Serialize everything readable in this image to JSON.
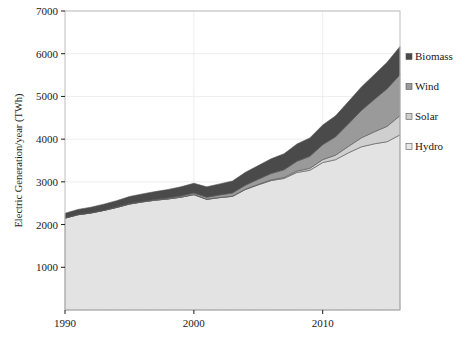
{
  "chart_data": {
    "type": "area",
    "stacked": true,
    "title": "",
    "xlabel": "",
    "ylabel": "Electric Generation/year (TWh)",
    "xlim": [
      1990,
      2016
    ],
    "ylim": [
      0,
      7000
    ],
    "ytick_labels": [
      "1000",
      "2000",
      "3000",
      "4000",
      "5000",
      "6000",
      "7000"
    ],
    "ytick_values": [
      1000,
      2000,
      3000,
      4000,
      5000,
      6000,
      7000
    ],
    "xtick_labels": [
      "1990",
      "2000",
      "2010"
    ],
    "xtick_values": [
      1990,
      2000,
      2010
    ],
    "grid": true,
    "legend_position": "right-outside",
    "x": [
      1990,
      1991,
      1992,
      1993,
      1994,
      1995,
      1996,
      1997,
      1998,
      1999,
      2000,
      2001,
      2002,
      2003,
      2004,
      2005,
      2006,
      2007,
      2008,
      2009,
      2010,
      2011,
      2012,
      2013,
      2014,
      2015,
      2016
    ],
    "series": [
      {
        "name": "Hydro",
        "color": "#e3e3e3",
        "values": [
          2150,
          2230,
          2270,
          2330,
          2400,
          2480,
          2530,
          2570,
          2600,
          2640,
          2700,
          2590,
          2630,
          2660,
          2820,
          2930,
          3030,
          3080,
          3220,
          3270,
          3450,
          3520,
          3680,
          3820,
          3890,
          3940,
          4100
        ]
      },
      {
        "name": "Solar",
        "color": "#cfcfcf",
        "values": [
          0,
          0,
          0,
          0,
          0,
          0,
          0,
          1,
          1,
          2,
          2,
          3,
          4,
          5,
          7,
          11,
          16,
          22,
          32,
          47,
          70,
          105,
          150,
          210,
          280,
          360,
          450
        ]
      },
      {
        "name": "Wind",
        "color": "#9a9a9a",
        "values": [
          4,
          5,
          6,
          7,
          9,
          11,
          13,
          16,
          21,
          27,
          35,
          45,
          58,
          75,
          95,
          120,
          150,
          180,
          230,
          280,
          350,
          430,
          530,
          640,
          760,
          880,
          960
        ]
      },
      {
        "name": "Biomass",
        "color": "#4a4a4a",
        "values": [
          110,
          120,
          130,
          140,
          150,
          165,
          175,
          185,
          200,
          215,
          230,
          245,
          260,
          280,
          300,
          320,
          345,
          375,
          405,
          430,
          460,
          490,
          520,
          550,
          580,
          620,
          660
        ]
      }
    ],
    "totals": [
      2264,
      2355,
      2406,
      2477,
      2559,
      2656,
      2718,
      2772,
      2822,
      2884,
      2967,
      2883,
      2952,
      3020,
      3222,
      3381,
      3541,
      3657,
      3887,
      4027,
      4330,
      4545,
      4880,
      5220,
      5510,
      5800,
      6170
    ]
  },
  "legend": {
    "items": [
      {
        "label": "Biomass",
        "color": "#4a4a4a"
      },
      {
        "label": "Wind",
        "color": "#9a9a9a"
      },
      {
        "label": "Solar",
        "color": "#cfcfcf"
      },
      {
        "label": "Hydro",
        "color": "#e9e9e9"
      }
    ]
  },
  "caption": {
    "text": ""
  }
}
